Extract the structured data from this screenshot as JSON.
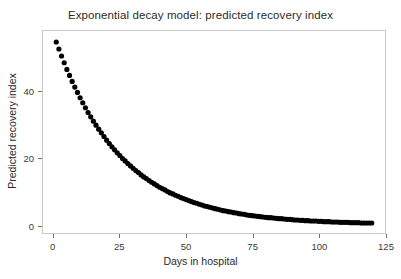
{
  "chart_data": {
    "type": "scatter",
    "title": "Exponential decay model: predicted recovery index",
    "xlabel": "Days in hospital",
    "ylabel": "Predicted recovery index",
    "xlim": [
      -4,
      125
    ],
    "ylim": [
      -2.5,
      58
    ],
    "xticks": [
      0,
      25,
      50,
      75,
      100,
      125
    ],
    "yticks": [
      0,
      20,
      40
    ],
    "xtick_labels": [
      "0",
      "25",
      "50",
      "75",
      "100",
      "125"
    ],
    "ytick_labels": [
      "0",
      "20",
      "40"
    ],
    "grid": false,
    "legend": null,
    "marker": {
      "shape": "circle",
      "color": "#000000",
      "size": 2.6
    },
    "series": [
      {
        "name": "predicted recovery index",
        "model": "y = 57.0 * exp(-0.0405 * t)",
        "x": [
          1,
          2,
          3,
          4,
          5,
          6,
          7,
          8,
          9,
          10,
          11,
          12,
          13,
          14,
          15,
          16,
          17,
          18,
          19,
          20,
          21,
          22,
          23,
          24,
          25,
          26,
          27,
          28,
          29,
          30,
          31,
          32,
          33,
          34,
          35,
          36,
          37,
          38,
          39,
          40,
          41,
          42,
          43,
          44,
          45,
          46,
          47,
          48,
          49,
          50,
          51,
          52,
          53,
          54,
          55,
          56,
          57,
          58,
          59,
          60,
          61,
          62,
          63,
          64,
          65,
          66,
          67,
          68,
          69,
          70,
          71,
          72,
          73,
          74,
          75,
          76,
          77,
          78,
          79,
          80,
          81,
          82,
          83,
          84,
          85,
          86,
          87,
          88,
          89,
          90,
          91,
          92,
          93,
          94,
          95,
          96,
          97,
          98,
          99,
          100,
          101,
          102,
          103,
          104,
          105,
          106,
          107,
          108,
          109,
          110,
          111,
          112,
          113,
          114,
          115,
          116,
          117,
          118,
          119,
          120
        ],
        "y": [
          54.7,
          52.6,
          50.5,
          48.5,
          46.5,
          44.7,
          42.9,
          41.2,
          39.6,
          38.0,
          36.5,
          35.0,
          33.6,
          32.3,
          31.0,
          29.8,
          28.6,
          27.5,
          26.4,
          25.3,
          24.3,
          23.3,
          22.4,
          21.5,
          20.7,
          19.8,
          19.1,
          18.3,
          17.6,
          16.9,
          16.2,
          15.6,
          14.9,
          14.3,
          13.8,
          13.2,
          12.7,
          12.2,
          11.7,
          11.2,
          10.8,
          10.4,
          9.9,
          9.5,
          9.2,
          8.8,
          8.5,
          8.1,
          7.8,
          7.5,
          7.2,
          6.9,
          6.6,
          6.4,
          6.1,
          5.9,
          5.6,
          5.4,
          5.2,
          5.0,
          4.8,
          4.6,
          4.4,
          4.2,
          4.1,
          3.9,
          3.8,
          3.6,
          3.5,
          3.3,
          3.2,
          3.1,
          2.9,
          2.8,
          2.7,
          2.6,
          2.5,
          2.4,
          2.3,
          2.2,
          2.1,
          2.1,
          2.0,
          1.9,
          1.8,
          1.8,
          1.7,
          1.6,
          1.6,
          1.5,
          1.4,
          1.4,
          1.3,
          1.3,
          1.2,
          1.2,
          1.1,
          1.1,
          1.1,
          1.0,
          1.0,
          0.9,
          0.9,
          0.9,
          0.8,
          0.8,
          0.8,
          0.7,
          0.7,
          0.7,
          0.7,
          0.6,
          0.6,
          0.6,
          0.6,
          0.5,
          0.5,
          0.5,
          0.5,
          0.5
        ]
      }
    ]
  }
}
